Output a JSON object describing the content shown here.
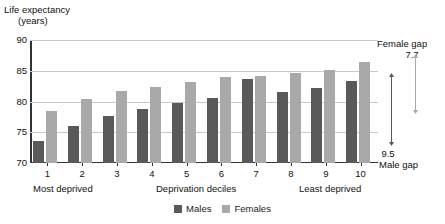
{
  "chart_data": {
    "type": "bar",
    "title": "",
    "subtitle": "",
    "ylabel_line1": "Life expectancy",
    "ylabel_line2": "(years)",
    "xlabel": "Deprivation deciles",
    "xlabel_left": "Most deprived",
    "xlabel_right": "Least deprived",
    "categories": [
      "1",
      "2",
      "3",
      "4",
      "5",
      "6",
      "7",
      "8",
      "9",
      "10"
    ],
    "series": [
      {
        "name": "Males",
        "color": "#595959",
        "values": [
          73.6,
          76.0,
          77.6,
          78.8,
          79.8,
          80.6,
          83.6,
          81.6,
          82.2,
          83.4
        ]
      },
      {
        "name": "Females",
        "color": "#a9a9a9",
        "values": [
          78.5,
          80.4,
          81.7,
          82.3,
          83.2,
          84.0,
          84.1,
          84.7,
          85.1,
          86.5
        ]
      }
    ],
    "ylim": [
      70,
      90
    ],
    "yticks": [
      "70",
      "75",
      "80",
      "85",
      "90"
    ],
    "grid": true,
    "legend_position": "bottom-center",
    "annotations": [
      {
        "id": "female-gap",
        "label": "Female gap",
        "value": "7.7",
        "series": "Females",
        "from": 78.8,
        "to": 86.5
      },
      {
        "id": "male-gap",
        "label": "Male gap",
        "value": "9.5",
        "series": "Males",
        "from": 73.9,
        "to": 83.4
      }
    ]
  },
  "legend": {
    "items": [
      {
        "label": "Males",
        "color": "#595959"
      },
      {
        "label": "Females",
        "color": "#a9a9a9"
      }
    ]
  }
}
